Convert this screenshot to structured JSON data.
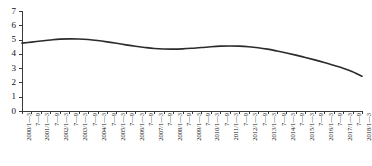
{
  "chart_data": {
    "type": "line",
    "title": "",
    "subtitle": "",
    "xlabel": "",
    "ylabel": "",
    "ylim": [
      0,
      7
    ],
    "yticks": [
      0,
      1,
      2,
      3,
      4,
      5,
      6,
      7
    ],
    "ytick_labels": [
      "0",
      "1",
      "2",
      "3",
      "4",
      "5",
      "6",
      "7"
    ],
    "grid": false,
    "legend": null,
    "legend_position": "none",
    "line_color": "#2b2b2b",
    "axis_color": "#3a3a3a",
    "background_color": "#ffffff",
    "categories": [
      "2000/1—3",
      "7—9",
      "2001/1—3",
      "7—9",
      "2002/1—3",
      "7—9",
      "2003/1—3",
      "7—9",
      "2004/1—3",
      "7—9",
      "2005/1—3",
      "7—9",
      "2006/1—3",
      "7—9",
      "2007/1—3",
      "7—9",
      "2008/1—3",
      "7—9",
      "2009/1—3",
      "7—9",
      "2010/1—3",
      "7—9",
      "2011/1—3",
      "7—9",
      "2012/1—3",
      "7—9",
      "2013/1—3",
      "7—9",
      "2014/1—3",
      "7—9",
      "2015/1—3",
      "7—9",
      "2016/1—3",
      "7—9",
      "2017/1—3",
      "7—9",
      "2018/1—3"
    ],
    "series": [
      {
        "name": "value",
        "values": [
          4.75,
          4.82,
          4.9,
          4.97,
          5.03,
          5.05,
          5.04,
          5.0,
          4.93,
          4.84,
          4.74,
          4.63,
          4.53,
          4.45,
          4.38,
          4.34,
          4.33,
          4.35,
          4.39,
          4.44,
          4.5,
          4.54,
          4.55,
          4.54,
          4.5,
          4.43,
          4.33,
          4.2,
          4.06,
          3.91,
          3.75,
          3.58,
          3.4,
          3.2,
          3.0,
          2.75,
          2.43
        ]
      }
    ]
  }
}
